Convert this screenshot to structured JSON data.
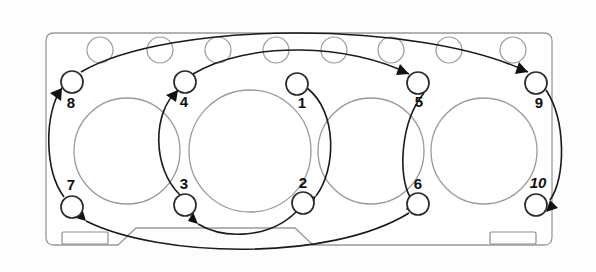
{
  "diagram": {
    "type": "engine-head-bolt-pattern",
    "colors": {
      "outline": "#9a9a9a",
      "bolt_stroke": "#2b2b2b",
      "sequence_line": "#1a1a1a",
      "label_text": "#111111",
      "background": "#ffffff"
    },
    "gasket": {
      "shape": "rounded-rectangle-with-bottom-notch",
      "left": 46,
      "top": 33,
      "right": 552,
      "bottom": 245,
      "corner_radius": 8
    },
    "cylinder_bores": [
      {
        "label": "bore-1",
        "cx": 127,
        "cy": 151,
        "r": 53
      },
      {
        "label": "bore-2",
        "cx": 250,
        "cy": 151,
        "r": 61
      },
      {
        "label": "bore-3",
        "cx": 371,
        "cy": 151,
        "r": 53
      },
      {
        "label": "bore-4",
        "cx": 484,
        "cy": 151,
        "r": 53
      }
    ],
    "water_holes": [
      {
        "label": "water-hole-1",
        "cx": 100,
        "cy": 50,
        "r": 13
      },
      {
        "label": "water-hole-2",
        "cx": 160,
        "cy": 50,
        "r": 13
      },
      {
        "label": "water-hole-3",
        "cx": 218,
        "cy": 50,
        "r": 13
      },
      {
        "label": "water-hole-4",
        "cx": 276,
        "cy": 50,
        "r": 13
      },
      {
        "label": "water-hole-5",
        "cx": 334,
        "cy": 50,
        "r": 13
      },
      {
        "label": "water-hole-6",
        "cx": 391,
        "cy": 50,
        "r": 13
      },
      {
        "label": "water-hole-7",
        "cx": 449,
        "cy": 50,
        "r": 13
      },
      {
        "label": "water-hole-8",
        "cx": 513,
        "cy": 50,
        "r": 13
      }
    ],
    "oil_slots": [
      {
        "label": "slot-left",
        "x": 62,
        "y": 232,
        "width": 46,
        "height": 12
      },
      {
        "label": "slot-right",
        "x": 490,
        "y": 232,
        "width": 46,
        "height": 12
      }
    ],
    "bolts": [
      {
        "number": "1",
        "cx": 297,
        "cy": 84,
        "r": 11,
        "label_x": 302,
        "label_y": 104,
        "italic": false
      },
      {
        "number": "2",
        "cx": 303,
        "cy": 203,
        "r": 11,
        "label_x": 303,
        "label_y": 184,
        "italic": false
      },
      {
        "number": "3",
        "cx": 185,
        "cy": 205,
        "r": 11,
        "label_x": 184,
        "label_y": 185,
        "italic": false
      },
      {
        "number": "4",
        "cx": 185,
        "cy": 82,
        "r": 11,
        "label_x": 184,
        "label_y": 103,
        "italic": false
      },
      {
        "number": "5",
        "cx": 418,
        "cy": 83,
        "r": 11,
        "label_x": 419,
        "label_y": 103,
        "italic": false
      },
      {
        "number": "6",
        "cx": 418,
        "cy": 204,
        "r": 11,
        "label_x": 418,
        "label_y": 185,
        "italic": false
      },
      {
        "number": "7",
        "cx": 72,
        "cy": 207,
        "r": 11,
        "label_x": 71,
        "label_y": 186,
        "italic": false
      },
      {
        "number": "8",
        "cx": 72,
        "cy": 82,
        "r": 11,
        "label_x": 71,
        "label_y": 104,
        "italic": false
      },
      {
        "number": "9",
        "cx": 536,
        "cy": 83,
        "r": 11,
        "label_x": 539,
        "label_y": 104,
        "italic": false
      },
      {
        "number": "10",
        "cx": 536,
        "cy": 205,
        "r": 11,
        "label_x": 538,
        "label_y": 184,
        "italic": true
      }
    ],
    "sequence_order": [
      "1",
      "2",
      "3",
      "4",
      "5",
      "6",
      "7",
      "8",
      "9",
      "10"
    ],
    "sequence_arcs": [
      {
        "from": "1",
        "to": "2",
        "name": "arc-1-to-2"
      },
      {
        "from": "2",
        "to": "3",
        "name": "arc-2-to-3"
      },
      {
        "from": "3",
        "to": "4",
        "name": "arc-3-to-4"
      },
      {
        "from": "4",
        "to": "5",
        "name": "arc-4-to-5"
      },
      {
        "from": "5",
        "to": "6",
        "name": "arc-5-to-6"
      },
      {
        "from": "6",
        "to": "7",
        "name": "arc-6-to-7"
      },
      {
        "from": "7",
        "to": "8",
        "name": "arc-7-to-8"
      },
      {
        "from": "8",
        "to": "9",
        "name": "arc-8-to-9"
      },
      {
        "from": "9",
        "to": "10",
        "name": "arc-9-to-10"
      }
    ]
  }
}
